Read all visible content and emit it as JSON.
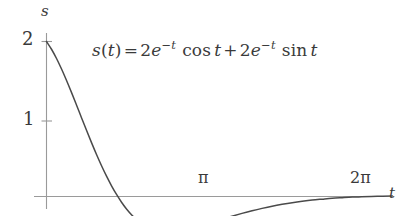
{
  "figure": {
    "background_color": "#ffffff",
    "curve_color": "#4a4a4a",
    "axis_color": "#8c8c8c",
    "text_color": "#3a3a3a"
  },
  "equation": {
    "lhs_var": "s",
    "lhs_open": "(",
    "lhs_arg": "t",
    "lhs_close": ")",
    "equals": "=",
    "term1_coeff": "2",
    "term1_base": "e",
    "term1_exponent": "−t",
    "term1_func": "cos",
    "term1_func_arg": "t",
    "plus": "+",
    "term2_coeff": "2",
    "term2_base": "e",
    "term2_exponent": "−t",
    "term2_func": "sin",
    "term2_func_arg": "t",
    "plain_text": "s(t) = 2e^{-t} cos t + 2e^{-t} sin t"
  },
  "axes": {
    "y_axis_label": "s",
    "x_axis_label": "t",
    "y_ticks": [
      {
        "label": "2",
        "value": 2
      },
      {
        "label": "1",
        "value": 1
      }
    ],
    "x_ticks": [
      {
        "label": "π",
        "value": 3.14159
      },
      {
        "label": "2π",
        "value": 6.28319
      }
    ]
  },
  "chart_data": {
    "type": "line",
    "title": "",
    "subtitle": "",
    "xlabel": "t",
    "ylabel": "s",
    "grid": false,
    "legend": "none",
    "annotations": [
      {
        "text": "s(t) = 2e^{-t} cos t + 2e^{-t} sin t",
        "x": 0.95,
        "y": 1.72
      }
    ],
    "xlim": [
      0,
      6.9
    ],
    "ylim": [
      -0.12,
      2.12
    ],
    "xtick_labels": [
      "π",
      "2π"
    ],
    "xtick_values": [
      3.14159,
      6.28319
    ],
    "ytick_labels": [
      "1",
      "2"
    ],
    "ytick_values": [
      1,
      2
    ],
    "series": [
      {
        "name": "s(t) = 2e^{-t} cos t + 2e^{-t} sin t",
        "color": "#4a4a4a",
        "x": [
          0.0,
          0.1,
          0.2,
          0.3,
          0.4,
          0.5,
          0.6,
          0.7,
          0.8,
          0.9,
          1.0,
          1.1,
          1.2,
          1.3,
          1.4,
          1.5,
          1.6,
          1.7,
          1.8,
          1.9,
          2.0,
          2.1,
          2.2,
          2.3,
          2.4,
          2.5,
          2.6,
          2.7,
          2.8,
          2.9,
          3.0,
          3.14159,
          3.3,
          3.5,
          3.7,
          3.9,
          4.1,
          4.3,
          4.5,
          4.7,
          4.9,
          5.1,
          5.3,
          5.5,
          5.7,
          5.9,
          6.1,
          6.28319,
          6.6,
          6.9
        ],
        "y": [
          2.0,
          1.9,
          1.781,
          1.645,
          1.497,
          1.34,
          1.178,
          1.014,
          0.851,
          0.692,
          0.539,
          0.394,
          0.259,
          0.135,
          0.023,
          -0.077,
          -0.164,
          -0.238,
          -0.301,
          -0.352,
          -0.392,
          -0.422,
          -0.443,
          -0.456,
          -0.462,
          -0.461,
          -0.455,
          -0.445,
          -0.431,
          -0.414,
          -0.394,
          -0.363,
          -0.331,
          -0.292,
          -0.254,
          -0.218,
          -0.184,
          -0.153,
          -0.125,
          -0.101,
          -0.08,
          -0.062,
          -0.046,
          -0.034,
          -0.023,
          -0.015,
          -0.008,
          -0.004,
          0.002,
          0.005
        ]
      }
    ]
  }
}
